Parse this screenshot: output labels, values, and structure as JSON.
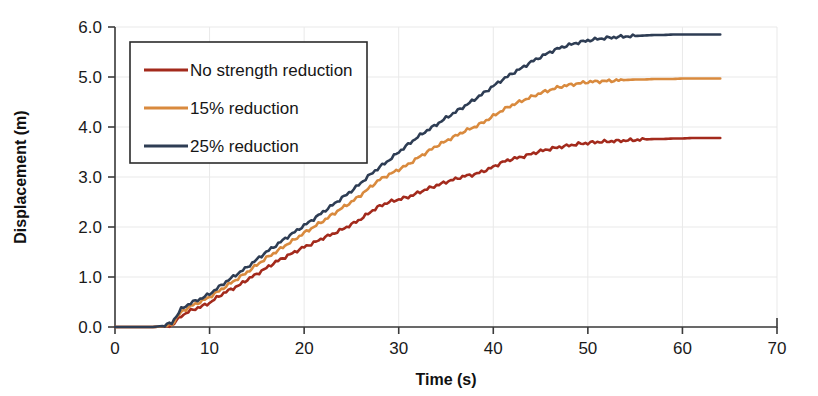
{
  "chart_data": {
    "type": "line",
    "title": "",
    "xlabel": "Time (s)",
    "ylabel": "Displacement (m)",
    "xlim": [
      0,
      70
    ],
    "ylim": [
      0.0,
      6.0
    ],
    "xticks": [
      "0",
      "10",
      "20",
      "30",
      "40",
      "50",
      "60",
      "70"
    ],
    "yticks": [
      "0.0",
      "1.0",
      "2.0",
      "3.0",
      "4.0",
      "5.0",
      "6.0"
    ],
    "grid": true,
    "legend_position": "upper-left-inside",
    "x": [
      0,
      1,
      2,
      3,
      4,
      5,
      6,
      7,
      8,
      9,
      10,
      11,
      12,
      13,
      14,
      15,
      16,
      17,
      18,
      19,
      20,
      21,
      22,
      23,
      24,
      25,
      26,
      27,
      28,
      29,
      30,
      31,
      32,
      33,
      34,
      35,
      36,
      37,
      38,
      39,
      40,
      41,
      42,
      43,
      44,
      45,
      46,
      47,
      48,
      49,
      50,
      51,
      52,
      53,
      54,
      55,
      56,
      57,
      58,
      59,
      60,
      61,
      62,
      63,
      64
    ],
    "series": [
      {
        "name": "No strength reduction",
        "color": "#A32A1C",
        "values": [
          0.0,
          0.0,
          0.0,
          0.0,
          0.0,
          0.01,
          0.03,
          0.22,
          0.33,
          0.4,
          0.48,
          0.62,
          0.73,
          0.82,
          0.95,
          1.06,
          1.18,
          1.3,
          1.4,
          1.5,
          1.6,
          1.68,
          1.78,
          1.86,
          1.95,
          2.05,
          2.16,
          2.3,
          2.42,
          2.5,
          2.55,
          2.6,
          2.68,
          2.76,
          2.83,
          2.9,
          2.96,
          3.02,
          3.05,
          3.12,
          3.2,
          3.3,
          3.36,
          3.4,
          3.46,
          3.52,
          3.56,
          3.6,
          3.63,
          3.66,
          3.68,
          3.7,
          3.71,
          3.72,
          3.73,
          3.74,
          3.75,
          3.76,
          3.76,
          3.77,
          3.77,
          3.78,
          3.78,
          3.78,
          3.78
        ]
      },
      {
        "name": "15% reduction",
        "color": "#D98A3E",
        "values": [
          0.0,
          0.0,
          0.0,
          0.0,
          0.0,
          0.01,
          0.05,
          0.3,
          0.42,
          0.5,
          0.6,
          0.72,
          0.85,
          0.97,
          1.1,
          1.24,
          1.38,
          1.5,
          1.63,
          1.75,
          1.88,
          2.0,
          2.12,
          2.25,
          2.38,
          2.5,
          2.64,
          2.8,
          2.95,
          3.05,
          3.15,
          3.25,
          3.38,
          3.5,
          3.62,
          3.72,
          3.82,
          3.92,
          4.0,
          4.1,
          4.22,
          4.34,
          4.44,
          4.52,
          4.6,
          4.68,
          4.74,
          4.8,
          4.84,
          4.87,
          4.9,
          4.91,
          4.92,
          4.93,
          4.94,
          4.95,
          4.95,
          4.96,
          4.96,
          4.96,
          4.97,
          4.97,
          4.97,
          4.97,
          4.97
        ]
      },
      {
        "name": "25% reduction",
        "color": "#2E3D54",
        "values": [
          0.0,
          0.0,
          0.0,
          0.0,
          0.0,
          0.02,
          0.08,
          0.36,
          0.48,
          0.56,
          0.66,
          0.8,
          0.94,
          1.07,
          1.2,
          1.35,
          1.5,
          1.63,
          1.77,
          1.9,
          2.03,
          2.16,
          2.3,
          2.44,
          2.58,
          2.72,
          2.88,
          3.05,
          3.2,
          3.34,
          3.5,
          3.65,
          3.8,
          3.93,
          4.05,
          4.18,
          4.3,
          4.42,
          4.55,
          4.68,
          4.82,
          4.95,
          5.07,
          5.18,
          5.3,
          5.4,
          5.5,
          5.58,
          5.64,
          5.69,
          5.73,
          5.76,
          5.78,
          5.8,
          5.81,
          5.82,
          5.83,
          5.84,
          5.84,
          5.85,
          5.85,
          5.85,
          5.85,
          5.85,
          5.85
        ]
      }
    ]
  },
  "legend": {
    "items": [
      {
        "label": "No strength reduction",
        "color": "#A32A1C"
      },
      {
        "label": "15% reduction",
        "color": "#D98A3E"
      },
      {
        "label": "25% reduction",
        "color": "#2E3D54"
      }
    ]
  }
}
